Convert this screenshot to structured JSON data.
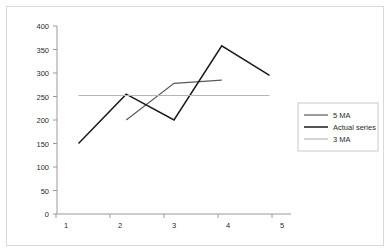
{
  "chart_data": {
    "type": "line",
    "title": "",
    "xlabel": "",
    "ylabel": "",
    "x": [
      1,
      2,
      3,
      4,
      5
    ],
    "xticklabels": [
      "1",
      "2",
      "3",
      "4",
      "5"
    ],
    "xlim": [
      0.55,
      5.45
    ],
    "ylim": [
      0,
      400
    ],
    "yticks": [
      0,
      50,
      100,
      150,
      200,
      250,
      300,
      350,
      400
    ],
    "yticklabels": [
      "0",
      "50",
      "100",
      "150",
      "200",
      "250",
      "300",
      "350",
      "400"
    ],
    "grid": false,
    "legend_position": "right",
    "series": [
      {
        "name": "5 MA",
        "color": "#5a5a5a",
        "width": 1.2,
        "x": [
          2,
          3,
          4
        ],
        "values": [
          200,
          278,
          285
        ]
      },
      {
        "name": "Actual series",
        "color": "#1a1a1a",
        "width": 1.5,
        "x": [
          1,
          2,
          3,
          4,
          5
        ],
        "values": [
          150,
          255,
          200,
          358,
          295
        ]
      },
      {
        "name": "3 MA",
        "color": "#b5b5b5",
        "width": 1.1,
        "x": [
          1,
          2,
          3,
          4,
          5
        ],
        "values": [
          252,
          252,
          252,
          252,
          252
        ]
      }
    ]
  },
  "legend": {
    "entries": [
      {
        "label": "5 MA"
      },
      {
        "label": "Actual series"
      },
      {
        "label": "3 MA"
      }
    ]
  },
  "axes": {
    "y_labels": [
      "400",
      "350",
      "300",
      "250",
      "200",
      "150",
      "100",
      "50",
      "0"
    ],
    "x_labels": [
      "1",
      "2",
      "3",
      "4",
      "5"
    ]
  }
}
